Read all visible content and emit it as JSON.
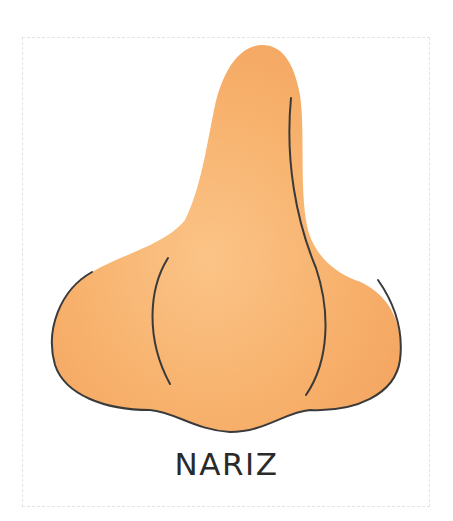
{
  "card": {
    "label": "NARIZ",
    "illustration": "nose-illustration",
    "colors": {
      "skin": "#f8b470",
      "skin_shade": "#f0a462",
      "outline": "#3a3a3a",
      "border": "#e6e2e0",
      "text": "#2a2a2a"
    }
  }
}
